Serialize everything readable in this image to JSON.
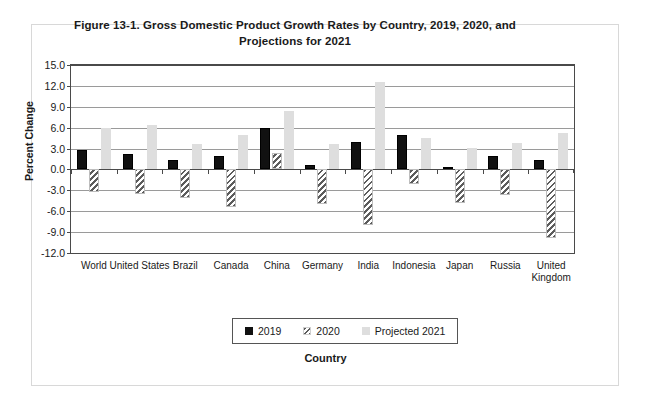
{
  "figure": {
    "title": "Figure 13-1. Gross Domestic Product Growth Rates by Country, 2019, 2020, and Projections for 2021"
  },
  "chart_data": {
    "type": "bar",
    "title": "Figure 13-1. Gross Domestic Product Growth Rates by Country, 2019, 2020, and Projections for 2021",
    "xlabel": "Country",
    "ylabel": "Percent Change",
    "ylim": [
      -12.0,
      15.0
    ],
    "ytick_step": 3.0,
    "yticks": [
      "15.0",
      "12.0",
      "9.0",
      "6.0",
      "3.0",
      "0.0",
      "-3.0",
      "-6.0",
      "-9.0",
      "-12.0"
    ],
    "ytick_values": [
      15.0,
      12.0,
      9.0,
      6.0,
      3.0,
      0.0,
      -3.0,
      -6.0,
      -9.0,
      -12.0
    ],
    "grid": true,
    "legend_position": "bottom",
    "categories": [
      "World",
      "United States",
      "Brazil",
      "Canada",
      "China",
      "Germany",
      "India",
      "Indonesia",
      "Japan",
      "Russia",
      "United Kingdom"
    ],
    "series": [
      {
        "name": "2019",
        "values": [
          2.8,
          2.2,
          1.4,
          1.9,
          6.0,
          0.6,
          4.0,
          5.0,
          0.3,
          2.0,
          1.4
        ]
      },
      {
        "name": "2020",
        "values": [
          -3.3,
          -3.5,
          -4.1,
          -5.4,
          2.3,
          -4.9,
          -8.0,
          -2.1,
          -4.8,
          -3.6,
          -9.9
        ]
      },
      {
        "name": "Projected 2021",
        "values": [
          5.9,
          6.4,
          3.7,
          5.0,
          8.4,
          3.6,
          12.5,
          4.5,
          3.1,
          3.8,
          5.3
        ]
      }
    ],
    "colors": {
      "2019": "#111111",
      "2020": "#5c5c5c",
      "Projected 2021": "#dedede"
    }
  }
}
